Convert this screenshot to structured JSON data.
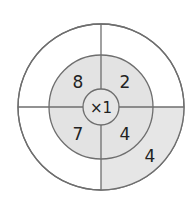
{
  "diagram": {
    "type": "multiplication-wheel",
    "center_label": "×1",
    "inner_ring": {
      "top_left": "8",
      "top_right": "2",
      "bottom_left": "7",
      "bottom_right": "4"
    },
    "outer_ring": {
      "top_left": "",
      "top_right": "",
      "bottom_left": "",
      "bottom_right": "4"
    },
    "colors": {
      "shade": "#e6e6e6",
      "line": "#6e6e6e",
      "background": "#ffffff",
      "text": "#222222"
    }
  }
}
